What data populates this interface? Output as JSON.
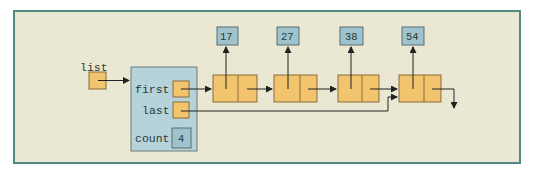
{
  "diagram": {
    "type": "linked-list",
    "list_label": "list",
    "header": {
      "fields": [
        {
          "name": "first"
        },
        {
          "name": "last"
        },
        {
          "name": "count",
          "value": "4"
        }
      ]
    },
    "nodes": [
      {
        "value": "17"
      },
      {
        "value": "27"
      },
      {
        "value": "38"
      },
      {
        "value": "54"
      }
    ],
    "colors": {
      "background": "#eae8d3",
      "frame_border": "#4f8a84",
      "header_fill": "#b7d3da",
      "pointer_fill": "#f2c46e",
      "value_fill": "#9ec3cc",
      "line": "#333333"
    }
  }
}
